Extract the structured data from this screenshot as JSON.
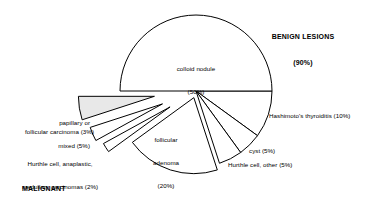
{
  "chart_data": {
    "type": "pie",
    "title": "",
    "subtitle": "",
    "xlabel": "",
    "ylabel": "",
    "legend_position": "callout-labels",
    "grid": false,
    "total_percent": 100,
    "units": "%",
    "groups": [
      {
        "name": "BENIGN LESIONS",
        "percent": 90,
        "label": "BENIGN LESIONS",
        "value_label": "(90%)"
      },
      {
        "name": "MALIGNANT LESIONS",
        "percent": 10,
        "label": "MALIGNANT",
        "label2": "LESIONS (10%)"
      }
    ],
    "categories": [
      "colloid nodule",
      "Hashimoto's thyroiditis",
      "cyst",
      "Hurthle cell, other",
      "follicular adenoma",
      "Hurthle cell, anaplastic, medullary carcinomas",
      "follicular carcinoma",
      "papillary or mixed"
    ],
    "values": [
      50,
      10,
      5,
      5,
      20,
      2,
      3,
      5
    ],
    "slices": [
      {
        "label": "colloid nodule",
        "value_label": "(50%)",
        "percent": 50,
        "group": "benign",
        "exploded": false,
        "fill": "#ffffff"
      },
      {
        "label": "Hashimoto's thyroiditis (10%)",
        "percent": 10,
        "group": "benign",
        "exploded": false,
        "fill": "#ffffff"
      },
      {
        "label": "cyst (5%)",
        "percent": 5,
        "group": "benign",
        "exploded": false,
        "fill": "#ffffff"
      },
      {
        "label": "Hurthle cell, other (5%)",
        "percent": 5,
        "group": "benign",
        "exploded": false,
        "fill": "#ffffff"
      },
      {
        "label": "follicular",
        "label2": "adenoma",
        "value_label": "(20%)",
        "percent": 20,
        "group": "benign",
        "exploded": true,
        "fill": "#ffffff"
      },
      {
        "label": "Hurthle cell, anaplastic,",
        "label2": "medullary carcinomas (2%)",
        "percent": 2,
        "group": "malignant",
        "exploded": true,
        "fill": "#ffffff"
      },
      {
        "label": "follicular carcinoma (3%)",
        "percent": 3,
        "group": "malignant",
        "exploded": true,
        "fill": "#ffffff"
      },
      {
        "label": "papillary or",
        "label2": "mixed (5%)",
        "percent": 5,
        "group": "malignant",
        "exploded": true,
        "fill": "#e8e8e8"
      }
    ],
    "colors": {
      "stroke": "#000000",
      "fill": "#ffffff",
      "shaded_fill": "#e8e8e8",
      "background": "#ffffff"
    }
  },
  "labels": {
    "benign_title": "BENIGN LESIONS",
    "benign_pct": "(90%)",
    "malignant_title": "MALIGNANT",
    "malignant_pct": "LESIONS (10%)",
    "colloid_nodule": "colloid nodule",
    "colloid_nodule_pct": "(50%)",
    "hashimoto": "Hashimoto's thyroiditis (10%)",
    "cyst": "cyst (5%)",
    "hurthle_other": "Hurthle cell, other (5%)",
    "follicular_adenoma_1": "follicular",
    "follicular_adenoma_2": "adenoma",
    "follicular_adenoma_pct": "(20%)",
    "hurthle_anaplastic_1": "Hurthle cell, anaplastic,",
    "hurthle_anaplastic_2": "medullary carcinomas (2%)",
    "follicular_carcinoma": "follicular carcinoma (3%)",
    "papillary_1": "papillary or",
    "papillary_2": "mixed (5%)"
  }
}
